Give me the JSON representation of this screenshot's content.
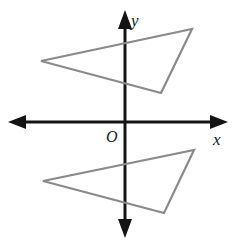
{
  "figure": {
    "background_color": "#ffffff",
    "width": 241,
    "height": 245
  },
  "axes": {
    "origin_label": "O",
    "x_axis_label": "x",
    "y_axis_label": "y",
    "axis_color": "#141414",
    "axis_stroke_width": 3,
    "origin_px": {
      "x": 125,
      "y": 122
    },
    "x_axis_extent_px": {
      "x1": 8,
      "x2": 228,
      "y": 122
    },
    "y_axis_extent_px": {
      "y1": 10,
      "y2": 238,
      "x": 125
    },
    "arrowheads": [
      "left",
      "right",
      "up",
      "down"
    ],
    "tick_marks": "none",
    "gridlines": "none"
  },
  "shapes": {
    "stroke_color": "#8a8a8a",
    "stroke_width": 2.2,
    "fill": "none",
    "items": [
      {
        "name": "upper-triangle",
        "label": "Triangle above the x-axis",
        "points_px": "41,61 192,29 161,93",
        "vertices_px": [
          {
            "x": 41,
            "y": 61
          },
          {
            "x": 192,
            "y": 29
          },
          {
            "x": 161,
            "y": 93
          }
        ]
      },
      {
        "name": "lower-triangle",
        "label": "Triangle below the x-axis",
        "points_px": "43,181 194,150 164,213",
        "vertices_px": [
          {
            "x": 43,
            "y": 181
          },
          {
            "x": 194,
            "y": 150
          },
          {
            "x": 164,
            "y": 213
          }
        ]
      }
    ]
  },
  "labels": {
    "origin": {
      "text": "O",
      "x": 106,
      "y": 142
    },
    "x": {
      "text": "x",
      "x": 213,
      "y": 145
    },
    "y": {
      "text": "y",
      "x": 131,
      "y": 26
    }
  }
}
